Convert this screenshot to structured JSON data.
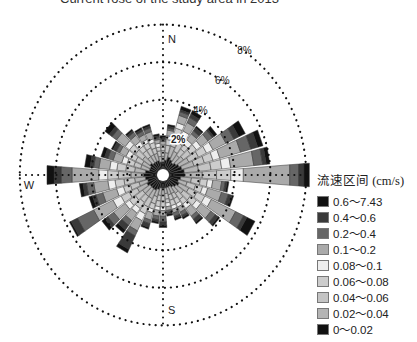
{
  "header": {
    "title": "Current rose of the study area in 2013"
  },
  "chart_data": {
    "type": "rose",
    "title": "Current rose of the study area in 2013",
    "center": [
      163,
      175
    ],
    "px_per_percent_x": 17.9,
    "px_per_percent_y": 18.8,
    "rings": [
      {
        "value": 2,
        "label": "2%"
      },
      {
        "value": 4,
        "label": "4%"
      },
      {
        "value": 6,
        "label": "6%"
      },
      {
        "value": 8,
        "label": "8%"
      }
    ],
    "cardinals": {
      "N": "N",
      "S": "S",
      "W": "W"
    },
    "legend_title": "流速区间 (cm/s)",
    "classes": [
      {
        "label": "0.6～7.43",
        "color": "#111111"
      },
      {
        "label": "0.4～0.6",
        "color": "#3a3a3a"
      },
      {
        "label": "0.2～0.4",
        "color": "#666666"
      },
      {
        "label": "0.1～0.2",
        "color": "#aaaaaa"
      },
      {
        "label": "0.08～0.1",
        "color": "#eeeeee"
      },
      {
        "label": "0.06～0.08",
        "color": "#cccccc"
      },
      {
        "label": "0.04～0.06",
        "color": "#c4c4c4"
      },
      {
        "label": "0.02～0.04",
        "color": "#b4b4b4"
      },
      {
        "label": "0～0.02",
        "color": "#111111"
      }
    ],
    "stack_order_from_center": [
      "0～0.02",
      "0.02～0.04",
      "0.04～0.06",
      "0.06～0.08",
      "0.08～0.1",
      "0.1～0.2",
      "0.2～0.4",
      "0.4～0.6",
      "0.6～7.43"
    ],
    "sectors_deg_width": 10,
    "petals": [
      {
        "dir": 0,
        "segs": [
          0.5,
          0.3,
          0.3,
          0.2,
          0.1,
          0.2,
          0.1,
          0.1,
          0.1
        ]
      },
      {
        "dir": 10,
        "segs": [
          0.6,
          0.4,
          0.4,
          0.3,
          0.2,
          0.3,
          0.1,
          0.1,
          0.1
        ]
      },
      {
        "dir": 20,
        "segs": [
          0.8,
          0.6,
          0.5,
          0.5,
          0.3,
          0.4,
          0.2,
          0.1,
          0.2
        ]
      },
      {
        "dir": 30,
        "segs": [
          0.7,
          0.5,
          0.5,
          0.4,
          0.3,
          0.5,
          0.3,
          0.2,
          0.2
        ]
      },
      {
        "dir": 40,
        "segs": [
          0.6,
          0.5,
          0.4,
          0.3,
          0.3,
          0.4,
          0.2,
          0.2,
          0.1
        ]
      },
      {
        "dir": 50,
        "segs": [
          0.7,
          0.5,
          0.5,
          0.4,
          0.3,
          0.5,
          0.3,
          0.1,
          0.2
        ]
      },
      {
        "dir": 60,
        "segs": [
          0.8,
          0.6,
          0.6,
          0.5,
          0.4,
          0.8,
          0.5,
          0.3,
          0.4
        ]
      },
      {
        "dir": 70,
        "segs": [
          0.9,
          0.7,
          0.6,
          0.5,
          0.4,
          1.2,
          0.6,
          0.4,
          0.3
        ]
      },
      {
        "dir": 80,
        "segs": [
          1.0,
          0.8,
          0.7,
          0.6,
          0.5,
          1.3,
          0.5,
          0.2,
          0.2
        ]
      },
      {
        "dir": 90,
        "segs": [
          1.0,
          1.0,
          0.8,
          0.8,
          0.7,
          2.6,
          0.5,
          0.3,
          0.3
        ]
      },
      {
        "dir": 100,
        "segs": [
          0.8,
          0.6,
          0.5,
          0.4,
          0.3,
          0.5,
          0.2,
          0.1,
          0.1
        ]
      },
      {
        "dir": 110,
        "segs": [
          0.7,
          0.5,
          0.5,
          0.4,
          0.3,
          0.8,
          0.4,
          0.2,
          0.1
        ]
      },
      {
        "dir": 120,
        "segs": [
          0.8,
          0.6,
          0.5,
          0.5,
          0.4,
          1.5,
          0.5,
          0.2,
          0.5
        ]
      },
      {
        "dir": 130,
        "segs": [
          0.7,
          0.5,
          0.5,
          0.4,
          0.3,
          0.7,
          0.3,
          0.2,
          0.1
        ]
      },
      {
        "dir": 140,
        "segs": [
          0.6,
          0.4,
          0.4,
          0.3,
          0.3,
          0.5,
          0.2,
          0.2,
          0.1
        ]
      },
      {
        "dir": 150,
        "segs": [
          0.5,
          0.4,
          0.3,
          0.3,
          0.2,
          0.3,
          0.2,
          0.1,
          0.1
        ]
      },
      {
        "dir": 160,
        "segs": [
          0.5,
          0.4,
          0.3,
          0.3,
          0.2,
          0.2,
          0.2,
          0.1,
          0.1
        ]
      },
      {
        "dir": 170,
        "segs": [
          0.5,
          0.3,
          0.3,
          0.2,
          0.2,
          0.2,
          0.1,
          0.1,
          0.1
        ]
      },
      {
        "dir": 180,
        "segs": [
          0.5,
          0.4,
          0.3,
          0.3,
          0.2,
          0.3,
          0.3,
          0.2,
          0.1
        ]
      },
      {
        "dir": 190,
        "segs": [
          0.5,
          0.4,
          0.3,
          0.3,
          0.2,
          0.3,
          0.2,
          0.1,
          0.1
        ]
      },
      {
        "dir": 200,
        "segs": [
          0.6,
          0.4,
          0.4,
          0.3,
          0.2,
          0.4,
          0.2,
          0.2,
          0.1
        ]
      },
      {
        "dir": 210,
        "segs": [
          0.7,
          0.5,
          0.5,
          0.4,
          0.4,
          0.6,
          0.3,
          0.8,
          0.2
        ]
      },
      {
        "dir": 220,
        "segs": [
          0.7,
          0.5,
          0.4,
          0.4,
          0.3,
          0.5,
          0.3,
          0.3,
          0.2
        ]
      },
      {
        "dir": 230,
        "segs": [
          0.7,
          0.5,
          0.5,
          0.4,
          0.3,
          0.8,
          0.4,
          0.2,
          0.2
        ]
      },
      {
        "dir": 240,
        "segs": [
          0.8,
          0.6,
          0.5,
          0.5,
          0.5,
          1.2,
          1.0,
          0.4,
          0.1
        ]
      },
      {
        "dir": 250,
        "segs": [
          0.7,
          0.5,
          0.5,
          0.4,
          0.4,
          0.8,
          0.4,
          0.2,
          0.2
        ]
      },
      {
        "dir": 260,
        "segs": [
          0.8,
          0.6,
          0.6,
          0.5,
          0.4,
          0.8,
          0.4,
          0.2,
          0.2
        ]
      },
      {
        "dir": 270,
        "segs": [
          0.9,
          0.7,
          0.7,
          0.6,
          0.5,
          1.5,
          0.6,
          0.4,
          0.4
        ]
      },
      {
        "dir": 280,
        "segs": [
          0.8,
          0.6,
          0.5,
          0.5,
          0.4,
          0.6,
          0.3,
          0.2,
          0.3
        ]
      },
      {
        "dir": 290,
        "segs": [
          0.6,
          0.5,
          0.4,
          0.4,
          0.3,
          0.5,
          0.3,
          0.2,
          0.2
        ]
      },
      {
        "dir": 300,
        "segs": [
          0.6,
          0.5,
          0.4,
          0.3,
          0.3,
          0.4,
          0.2,
          0.2,
          0.1
        ]
      },
      {
        "dir": 310,
        "segs": [
          0.7,
          0.5,
          0.5,
          0.4,
          0.3,
          0.6,
          0.3,
          0.2,
          0.3
        ]
      },
      {
        "dir": 320,
        "segs": [
          0.6,
          0.4,
          0.4,
          0.3,
          0.3,
          0.4,
          0.2,
          0.1,
          0.1
        ]
      },
      {
        "dir": 330,
        "segs": [
          0.6,
          0.4,
          0.4,
          0.3,
          0.2,
          0.3,
          0.2,
          0.1,
          0.1
        ]
      },
      {
        "dir": 340,
        "segs": [
          0.6,
          0.4,
          0.3,
          0.3,
          0.2,
          0.4,
          0.2,
          0.1,
          0.1
        ]
      },
      {
        "dir": 350,
        "segs": [
          0.5,
          0.3,
          0.3,
          0.2,
          0.2,
          0.2,
          0.1,
          0.1,
          0.1
        ]
      }
    ]
  }
}
